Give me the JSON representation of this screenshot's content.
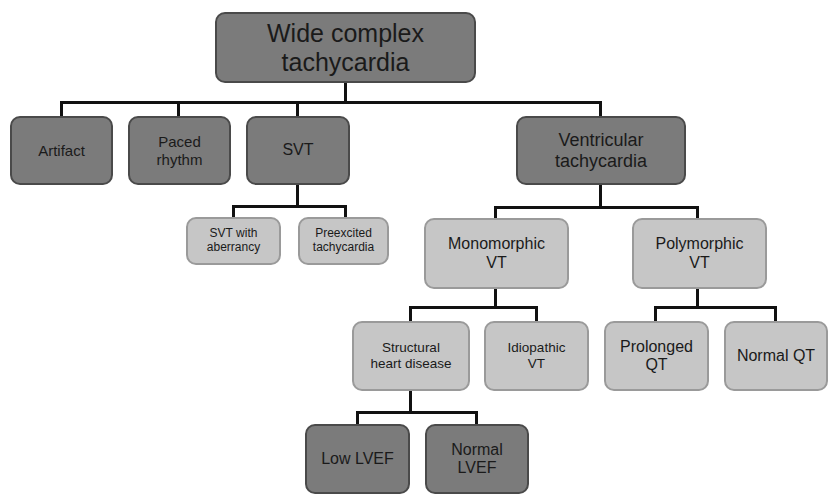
{
  "diagram": {
    "title": "Wide complex tachycardia",
    "colors": {
      "dark_fill": "#7b7b7b",
      "light_fill": "#c6c6c6",
      "connector": "#111111"
    },
    "nodes": {
      "root": {
        "label": "Wide complex\ntachycardia",
        "shade": "dark"
      },
      "artifact": {
        "label": "Artifact",
        "shade": "dark"
      },
      "paced": {
        "label": "Paced\nrhythm",
        "shade": "dark"
      },
      "svt": {
        "label": "SVT",
        "shade": "dark"
      },
      "vt": {
        "label": "Ventricular\ntachycardia",
        "shade": "dark"
      },
      "svt_aberrancy": {
        "label": "SVT with\naberrancy",
        "shade": "light"
      },
      "preexcited": {
        "label": "Preexcited\ntachycardia",
        "shade": "light"
      },
      "monomorphic": {
        "label": "Monomorphic\nVT",
        "shade": "light"
      },
      "polymorphic": {
        "label": "Polymorphic\nVT",
        "shade": "light"
      },
      "structural": {
        "label": "Structural\nheart disease",
        "shade": "light"
      },
      "idiopathic": {
        "label": "Idiopathic\nVT",
        "shade": "light"
      },
      "prolonged_qt": {
        "label": "Prolonged\nQT",
        "shade": "light"
      },
      "normal_qt": {
        "label": "Normal  QT",
        "shade": "light"
      },
      "low_lvef": {
        "label": "Low LVEF",
        "shade": "dark"
      },
      "normal_lvef": {
        "label": "Normal\nLVEF",
        "shade": "dark"
      }
    },
    "edges": [
      [
        "root",
        "artifact"
      ],
      [
        "root",
        "paced"
      ],
      [
        "root",
        "svt"
      ],
      [
        "root",
        "vt"
      ],
      [
        "svt",
        "svt_aberrancy"
      ],
      [
        "svt",
        "preexcited"
      ],
      [
        "vt",
        "monomorphic"
      ],
      [
        "vt",
        "polymorphic"
      ],
      [
        "monomorphic",
        "structural"
      ],
      [
        "monomorphic",
        "idiopathic"
      ],
      [
        "polymorphic",
        "prolonged_qt"
      ],
      [
        "polymorphic",
        "normal_qt"
      ],
      [
        "structural",
        "low_lvef"
      ],
      [
        "structural",
        "normal_lvef"
      ]
    ]
  }
}
